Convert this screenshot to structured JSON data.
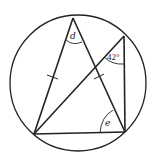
{
  "diagram": {
    "type": "circle-geometry",
    "circle": {
      "cx": 78,
      "cy": 83,
      "r": 68
    },
    "points": {
      "top": {
        "x": 73,
        "y": 18
      },
      "bottom_left": {
        "x": 34,
        "y": 134
      },
      "bottom_right": {
        "x": 125,
        "y": 132
      },
      "upper_right": {
        "x": 124,
        "y": 36
      }
    },
    "labels": {
      "angle_top": "d",
      "angle_upper_right": "42°",
      "angle_bottom_right": "e"
    },
    "stroke_color": "#222222",
    "background": "#ffffff"
  }
}
